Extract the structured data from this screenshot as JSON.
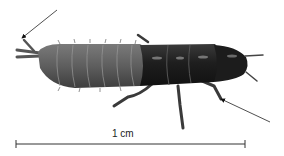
{
  "figure": {
    "scale_bar": {
      "label": "1 cm",
      "x1": 16,
      "x2": 245,
      "y": 144
    },
    "annotations": [
      {
        "name": "tail-appendage-arrow",
        "from": [
          57,
          10
        ],
        "to": [
          22,
          38
        ]
      },
      {
        "name": "front-leg-arrow",
        "from": [
          270,
          122
        ],
        "to": [
          221,
          99
        ]
      }
    ],
    "colors": {
      "background": "#ffffff",
      "abdomen": "#6b6b6b",
      "abdomen_dark": "#4a4a4a",
      "thorax": "#262626",
      "head": "#1c1c1c",
      "highlight": "#9a9a9a",
      "line": "#333333"
    }
  }
}
